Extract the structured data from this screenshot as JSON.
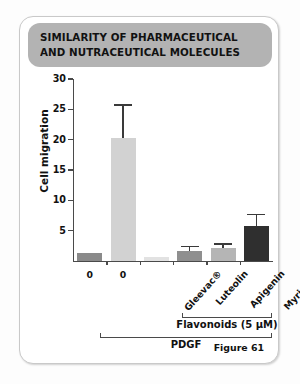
{
  "card": {
    "title": "SIMILARITY OF PHARMACEUTICAL AND NUTRACEUTICAL MOLECULES",
    "figure_caption": "Figure 61"
  },
  "chart_data": {
    "type": "bar",
    "title": "SIMILARITY OF PHARMACEUTICAL AND NUTRACEUTICAL MOLECULES",
    "xlabel": "",
    "ylabel": "Cell migration",
    "ylim": [
      0,
      30
    ],
    "yticks": [
      5,
      10,
      15,
      20,
      25,
      30
    ],
    "ytick_labels": [
      "5",
      "10",
      "15",
      "20",
      "25",
      "30"
    ],
    "grid": false,
    "legend": "none",
    "categories": [
      "0",
      "0",
      "Gleevac®",
      "Luteolin",
      "Apigenin",
      "Myricetin"
    ],
    "values": [
      1.3,
      20.2,
      0.6,
      1.6,
      2.1,
      5.7
    ],
    "errors": [
      0.0,
      5.6,
      0.0,
      0.9,
      0.8,
      2.0
    ],
    "bar_colors": [
      "#8a8a8a",
      "#d2d2d2",
      "#e2e2e2",
      "#8f8f8f",
      "#b5b5b5",
      "#2f2f2f"
    ],
    "annotations": [
      {
        "text": "Flavonoids (5 µM)",
        "covers": [
          "Luteolin",
          "Apigenin",
          "Myricetin"
        ]
      },
      {
        "text": "PDGF",
        "covers": [
          "0",
          "Gleevac®",
          "Luteolin",
          "Apigenin",
          "Myricetin"
        ]
      }
    ]
  },
  "brackets": {
    "flavonoids": "Flavonoids (5 µM)",
    "pdgf": "PDGF"
  },
  "colors": {
    "banner": "#b3b3b3",
    "axis": "#4a4a4a",
    "dark_bar": "#2f2f2f"
  }
}
